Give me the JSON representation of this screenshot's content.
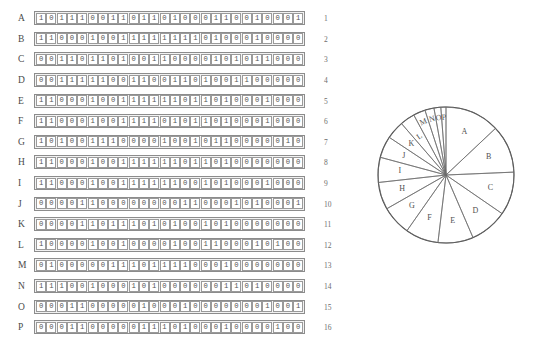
{
  "figure": {
    "title": "",
    "matrix": {
      "column_count": 26,
      "row_count": 16,
      "rows": [
        {
          "label": "A",
          "number": "1",
          "bits": "10111001101101000110010001"
        },
        {
          "label": "B",
          "number": "2",
          "bits": "11000100111111110100010000"
        },
        {
          "label": "C",
          "number": "3",
          "bits": "00110110100110000101011000"
        },
        {
          "label": "D",
          "number": "4",
          "bits": "00111110011001101001100000"
        },
        {
          "label": "E",
          "number": "5",
          "bits": "11000100111111011010001000"
        },
        {
          "label": "F",
          "number": "6",
          "bits": "11000100111101011010001000"
        },
        {
          "label": "G",
          "number": "7",
          "bits": "10100111000010010110000010"
        },
        {
          "label": "H",
          "number": "8",
          "bits": "11000100111111011010000000"
        },
        {
          "label": "I",
          "number": "9",
          "bits": "11000100111111001010001000"
        },
        {
          "label": "J",
          "number": "10",
          "bits": "00001100000000110001010001"
        },
        {
          "label": "K",
          "number": "11",
          "bits": "00001101110101001010000000"
        },
        {
          "label": "L",
          "number": "12",
          "bits": "10000100100001001100010100"
        },
        {
          "label": "M",
          "number": "13",
          "bits": "01000001110111100010000000"
        },
        {
          "label": "N",
          "number": "14",
          "bits": "11100100010100000011010000"
        },
        {
          "label": "O",
          "number": "15",
          "bits": "00011000001000100000001001"
        },
        {
          "label": "P",
          "number": "16",
          "bits": "00011000001110100010000100"
        }
      ]
    },
    "pie": {
      "type": "pie",
      "start_angle_deg": 0,
      "direction": "clockwise",
      "center_x": 86,
      "center_y": 89,
      "radius": 68,
      "label_radius_fraction": 0.68,
      "slices": [
        {
          "label": "A",
          "value": 13,
          "sweep_deg": 48.0
        },
        {
          "label": "B",
          "value": 13,
          "sweep_deg": 42.0
        },
        {
          "label": "C",
          "value": 12,
          "sweep_deg": 38.0
        },
        {
          "label": "D",
          "value": 11,
          "sweep_deg": 33.0
        },
        {
          "label": "E",
          "value": 11,
          "sweep_deg": 31.0
        },
        {
          "label": "F",
          "value": 11,
          "sweep_deg": 29.0
        },
        {
          "label": "G",
          "value": 10,
          "sweep_deg": 26.0
        },
        {
          "label": "H",
          "value": 10,
          "sweep_deg": 24.0
        },
        {
          "label": "I",
          "value": 9,
          "sweep_deg": 22.0
        },
        {
          "label": "J",
          "value": 8,
          "sweep_deg": 19.0
        },
        {
          "label": "K",
          "value": 8,
          "sweep_deg": 16.0
        },
        {
          "label": "L",
          "value": 7,
          "sweep_deg": 13.0
        },
        {
          "label": "M",
          "value": 6,
          "sweep_deg": 10.5
        },
        {
          "label": "N",
          "value": 5,
          "sweep_deg": 8.0
        },
        {
          "label": "O",
          "value": 5,
          "sweep_deg": 6.0
        },
        {
          "label": "P",
          "value": 4,
          "sweep_deg": 4.5
        }
      ]
    },
    "colors": {
      "cell_border": "#9a9a9a",
      "strip_border": "#8c8c8c",
      "strip_fill": "#f2f2f2",
      "pie_stroke": "#6a6a6a",
      "pie_outline": "#4a4a4a",
      "text": "#4f4f4f"
    }
  }
}
